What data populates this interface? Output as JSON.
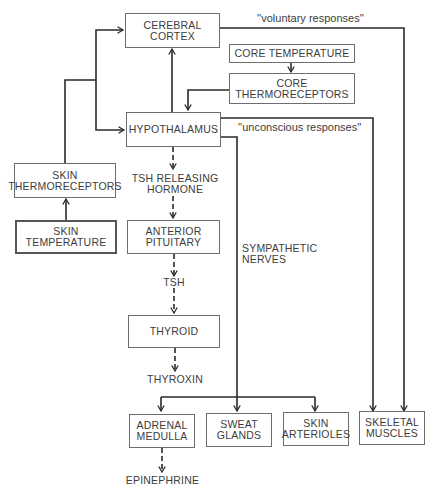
{
  "diagram": {
    "type": "flowchart",
    "nodes": {
      "cerebral_cortex": [
        "CEREBRAL",
        "CORTEX"
      ],
      "core_temperature": "CORE TEMPERATURE",
      "core_thermoreceptors": [
        "CORE",
        "THERMORECEPTORS"
      ],
      "hypothalamus": "HYPOTHALAMUS",
      "skin_thermoreceptors": [
        "SKIN",
        "THERMORECEPTORS"
      ],
      "skin_temperature": [
        "SKIN",
        "TEMPERATURE"
      ],
      "tsh_releasing_hormone": [
        "TSH RELEASING",
        "HORMONE"
      ],
      "anterior_pituitary": [
        "ANTERIOR",
        "PITUITARY"
      ],
      "tsh": "TSH",
      "thyroid": "THYROID",
      "thyroxin": "THYROXIN",
      "adrenal_medulla": [
        "ADRENAL",
        "MEDULLA"
      ],
      "sweat_glands": [
        "SWEAT",
        "GLANDS"
      ],
      "skin_arterioles": [
        "SKIN",
        "ARTERIOLES"
      ],
      "skeletal_muscles": [
        "SKELETAL",
        "MUSCLES"
      ],
      "epinephrine": "EPINEPHRINE"
    },
    "edge_labels": {
      "voluntary": "''voluntary responses''",
      "unconscious": "''unconscious responses''",
      "sympathetic": [
        "SYMPATHETIC",
        "NERVES"
      ]
    },
    "edges": [
      {
        "from": "skin_temperature",
        "to": "skin_thermoreceptors",
        "style": "solid"
      },
      {
        "from": "skin_thermoreceptors",
        "to": "cerebral_cortex",
        "style": "solid"
      },
      {
        "from": "skin_thermoreceptors",
        "to": "hypothalamus",
        "style": "solid"
      },
      {
        "from": "core_temperature",
        "to": "core_thermoreceptors",
        "style": "solid"
      },
      {
        "from": "core_thermoreceptors",
        "to": "hypothalamus",
        "style": "solid"
      },
      {
        "from": "hypothalamus",
        "to": "cerebral_cortex",
        "style": "solid"
      },
      {
        "from": "cerebral_cortex",
        "to": "skeletal_muscles",
        "style": "solid",
        "label": "voluntary"
      },
      {
        "from": "hypothalamus",
        "to": "skeletal_muscles",
        "style": "solid",
        "label": "unconscious"
      },
      {
        "from": "hypothalamus",
        "to": "tsh_releasing_hormone",
        "style": "dashed"
      },
      {
        "from": "tsh_releasing_hormone",
        "to": "anterior_pituitary",
        "style": "dashed"
      },
      {
        "from": "anterior_pituitary",
        "to": "tsh",
        "style": "dashed"
      },
      {
        "from": "tsh",
        "to": "thyroid",
        "style": "dashed"
      },
      {
        "from": "thyroid",
        "to": "thyroxin",
        "style": "dashed"
      },
      {
        "from": "hypothalamus",
        "to": "adrenal_medulla",
        "style": "solid",
        "label": "sympathetic"
      },
      {
        "from": "hypothalamus",
        "to": "sweat_glands",
        "style": "solid",
        "label": "sympathetic"
      },
      {
        "from": "hypothalamus",
        "to": "skin_arterioles",
        "style": "solid",
        "label": "sympathetic"
      },
      {
        "from": "adrenal_medulla",
        "to": "epinephrine",
        "style": "dashed"
      }
    ]
  }
}
